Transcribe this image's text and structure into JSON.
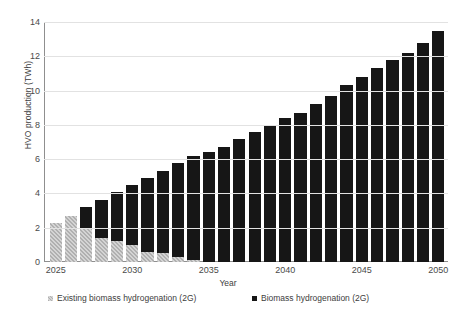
{
  "chart_data": {
    "type": "bar",
    "stacked": true,
    "title": "",
    "subtitle": "",
    "xlabel": "Year",
    "ylabel": "HVO production (TWh)",
    "ylim": [
      0,
      14
    ],
    "y_ticks": [
      0,
      2,
      4,
      6,
      8,
      10,
      12,
      14
    ],
    "x_tick_labels": [
      "2025",
      "2030",
      "2035",
      "2040",
      "2045",
      "2050"
    ],
    "grid": true,
    "legend_position": "bottom",
    "categories": [
      "2025",
      "2026",
      "2027",
      "2028",
      "2029",
      "2030",
      "2031",
      "2032",
      "2033",
      "2034",
      "2035",
      "2036",
      "2037",
      "2038",
      "2039",
      "2040",
      "2041",
      "2042",
      "2043",
      "2044",
      "2045",
      "2046",
      "2047",
      "2048",
      "2049",
      "2050"
    ],
    "series": [
      {
        "name": "Existing biomass hydrogenation (2G)",
        "color": "#b0b0b0",
        "pattern": "hatched",
        "values": [
          2.3,
          2.7,
          1.9,
          1.4,
          1.25,
          1.0,
          0.6,
          0.55,
          0.3,
          0.1,
          0.0,
          0.0,
          0.0,
          0.0,
          0.0,
          0.0,
          0.0,
          0.0,
          0.0,
          0.0,
          0.0,
          0.0,
          0.0,
          0.0,
          0.0,
          0.0
        ]
      },
      {
        "name": "Biomass hydrogenation (2G)",
        "color": "#161616",
        "pattern": "solid",
        "values": [
          0.0,
          0.0,
          1.3,
          2.2,
          2.85,
          3.5,
          4.3,
          4.75,
          5.5,
          6.1,
          6.4,
          6.7,
          7.2,
          7.6,
          8.0,
          8.4,
          8.7,
          9.2,
          9.7,
          10.3,
          10.8,
          11.3,
          11.8,
          12.2,
          12.8,
          13.5
        ]
      }
    ],
    "totals": [
      2.3,
      2.7,
      3.2,
      3.6,
      4.1,
      4.5,
      4.9,
      5.3,
      5.8,
      6.2,
      6.4,
      6.7,
      7.2,
      7.6,
      8.0,
      8.4,
      8.7,
      9.2,
      9.7,
      10.3,
      10.8,
      11.3,
      11.8,
      12.2,
      12.8,
      13.5
    ]
  },
  "legend": {
    "items": [
      {
        "label": "Existing biomass hydrogenation (2G)",
        "marker": "gray-hatched-square-icon"
      },
      {
        "label": "Biomass hydrogenation (2G)",
        "marker": "black-square-icon"
      }
    ]
  },
  "axes": {
    "x_title": "Year",
    "y_title": "HVO production (TWh)"
  }
}
